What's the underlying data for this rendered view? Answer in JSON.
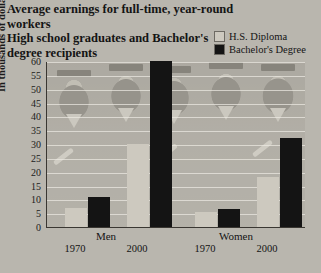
{
  "title": {
    "line1": "Average earnings for full-time, year-round workers",
    "line2": "High school graduates and Bachelor's",
    "line3": "degree recipients"
  },
  "legend": [
    {
      "label": "H.S. Diploma",
      "color": "#cdc9bf"
    },
    {
      "label": "Bachelor's Degree",
      "color": "#141414"
    }
  ],
  "axis": {
    "ylabel": "In thousands of dollars",
    "yticks": [
      "0",
      "5",
      "10",
      "15",
      "20",
      "25",
      "30",
      "35",
      "40",
      "45",
      "50",
      "55",
      "60"
    ],
    "groups": [
      "Men",
      "Women"
    ],
    "years": [
      "1970",
      "2000",
      "1970",
      "2000"
    ]
  },
  "chart_data": {
    "type": "bar",
    "title": "Average earnings for full-time, year-round workers High school graduates and Bachelor's degree recipients",
    "xlabel": "",
    "ylabel": "In thousands of dollars",
    "ylim": [
      0,
      60
    ],
    "ytick_step": 5,
    "grid": true,
    "legend_position": "top-right",
    "categories": [
      "Men 1970",
      "Men 2000",
      "Women 1970",
      "Women 2000"
    ],
    "groups": [
      {
        "name": "Men",
        "years": [
          "1970",
          "2000"
        ]
      },
      {
        "name": "Women",
        "years": [
          "1970",
          "2000"
        ]
      }
    ],
    "series": [
      {
        "name": "H.S. Diploma",
        "color": "#cdc9bf",
        "values": [
          7,
          30,
          5.5,
          18
        ]
      },
      {
        "name": "Bachelor's Degree",
        "color": "#141414",
        "values": [
          11,
          60,
          6.5,
          32
        ]
      }
    ]
  }
}
